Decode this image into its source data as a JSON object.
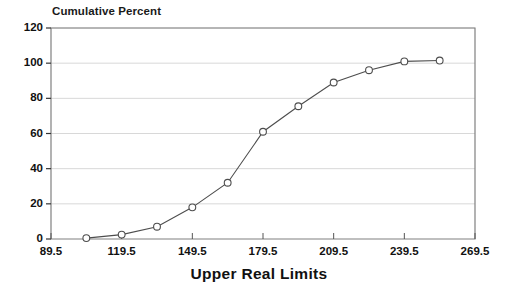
{
  "chart_data": {
    "type": "line",
    "title": "Cumulative Percent",
    "subtitle": "",
    "xlabel": "Upper Real Limits",
    "ylabel": "",
    "xlim": [
      89.5,
      269.5
    ],
    "ylim": [
      0,
      120
    ],
    "grid": true,
    "legend": false,
    "legend_position": "none",
    "marker": "open-circle",
    "line_color": "#4d4d4d",
    "marker_color": "#4d4d4d",
    "grid_color": "#d8d8d8",
    "axis_color": "#808080",
    "xticks": [
      "89.5",
      "119.5",
      "149.5",
      "179.5",
      "209.5",
      "239.5",
      "269.5"
    ],
    "xtick_values": [
      89.5,
      119.5,
      149.5,
      179.5,
      209.5,
      239.5,
      269.5
    ],
    "yticks": [
      "0",
      "20",
      "40",
      "60",
      "80",
      "100",
      "120"
    ],
    "ytick_values": [
      0,
      20,
      40,
      60,
      80,
      100,
      120
    ],
    "x": [
      104.5,
      119.5,
      134.5,
      149.5,
      164.5,
      179.5,
      194.5,
      209.5,
      224.5,
      239.5,
      254.5
    ],
    "values": [
      0.5,
      2.5,
      7,
      18,
      32,
      61,
      75.5,
      89,
      96,
      101,
      101.5
    ],
    "annotations": []
  }
}
